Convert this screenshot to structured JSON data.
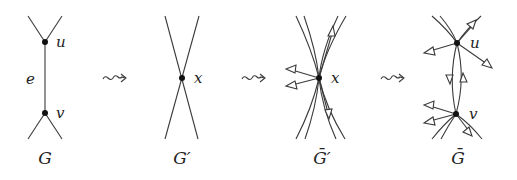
{
  "diagram": {
    "panels": [
      {
        "id": "G",
        "caption": "G",
        "vertices": [
          {
            "name": "u",
            "label": "u"
          },
          {
            "name": "v",
            "label": "v"
          }
        ],
        "edge_label": "e"
      },
      {
        "id": "G-prime",
        "caption": "G′",
        "vertices": [
          {
            "name": "x",
            "label": "x"
          }
        ]
      },
      {
        "id": "G-bar-prime",
        "caption": "Ḡ′",
        "vertices": [
          {
            "name": "x",
            "label": "x"
          }
        ]
      },
      {
        "id": "G-bar",
        "caption": "Ḡ",
        "vertices": [
          {
            "name": "u",
            "label": "u"
          },
          {
            "name": "v",
            "label": "v"
          }
        ]
      }
    ],
    "transition_symbol": "⇝",
    "colors": {
      "line": "#3a3a3a",
      "vertex": "#111111",
      "text": "#222222",
      "background": "#ffffff"
    }
  }
}
